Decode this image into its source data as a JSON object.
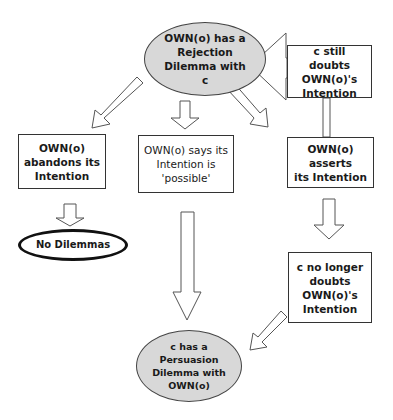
{
  "diagram": {
    "type": "flowchart",
    "nodes": {
      "rejection": {
        "label": "OWN(o) has a\nRejection\nDilemma with\nc",
        "shape": "ellipse",
        "fill": "#d8d8d8"
      },
      "still_doubts": {
        "label": "c still doubts\nOWN(o)'s\nIntention",
        "shape": "box"
      },
      "abandons": {
        "label": "OWN(o)\nabandons its\nIntention",
        "shape": "box"
      },
      "says_possible": {
        "label": "OWN(o) says its\nIntention is\n'possible'",
        "shape": "box"
      },
      "asserts": {
        "label": "OWN(o) asserts\nits Intention",
        "shape": "box"
      },
      "no_dilemmas": {
        "label": "No Dilemmas",
        "shape": "ellipse-outline"
      },
      "no_longer_doubts": {
        "label": "c no longer\ndoubts\nOWN(o)'s\nIntention",
        "shape": "box"
      },
      "persuasion": {
        "label": "c has a\nPersuasion\nDilemma with\nOWN(o)",
        "shape": "ellipse",
        "fill": "#d8d8d8"
      }
    },
    "edges": [
      {
        "from": "still_doubts",
        "to": "rejection"
      },
      {
        "from": "rejection",
        "to": "abandons"
      },
      {
        "from": "rejection",
        "to": "says_possible"
      },
      {
        "from": "rejection",
        "to": "asserts"
      },
      {
        "from": "still_doubts",
        "to": "asserts",
        "style": "connector"
      },
      {
        "from": "abandons",
        "to": "no_dilemmas"
      },
      {
        "from": "says_possible",
        "to": "persuasion"
      },
      {
        "from": "asserts",
        "to": "no_longer_doubts"
      },
      {
        "from": "no_longer_doubts",
        "to": "persuasion"
      }
    ]
  }
}
